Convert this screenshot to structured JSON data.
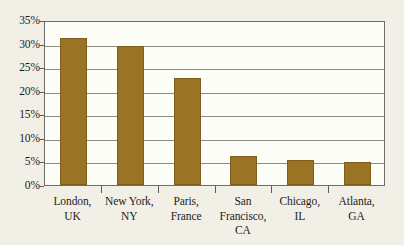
{
  "chart_data": {
    "type": "bar",
    "title": "",
    "subtitle": "",
    "xlabel": "",
    "ylabel": "",
    "categories": [
      "London, UK",
      "New York, NY",
      "Paris, France",
      "San Francisco, CA",
      "Chicago, IL",
      "Atlanta, GA"
    ],
    "category_lines": [
      [
        "London,",
        "UK"
      ],
      [
        "New York,",
        "NY"
      ],
      [
        "Paris,",
        "France"
      ],
      [
        "San",
        "Francisco,",
        "CA"
      ],
      [
        "Chicago,",
        "IL"
      ],
      [
        "Atlanta,",
        "GA"
      ]
    ],
    "values": [
      31.1,
      29.5,
      22.7,
      6.2,
      5.4,
      4.8
    ],
    "value_labels": [
      "31.1%",
      "29.5%",
      "22.7%",
      "6.2%",
      "5.4%",
      "4.8%"
    ],
    "ylim": [
      0,
      35
    ],
    "ytick_values": [
      0,
      5,
      10,
      15,
      20,
      25,
      30,
      35
    ],
    "ytick_labels": [
      "0%",
      "5%",
      "10%",
      "15%",
      "20%",
      "25%",
      "30%",
      "35%"
    ],
    "grid": true,
    "grid_axis": "y",
    "legend": false,
    "legend_position": "none",
    "bar_color": "#9a7324",
    "bar_edge_color": "#7d5d1c",
    "plot_background": "#fdfdf8",
    "figure_background": "#f2f0e6",
    "axis_color": "#6e6e66",
    "gridline_color": "#8c8c82",
    "text_color": "#1c1c1c"
  }
}
